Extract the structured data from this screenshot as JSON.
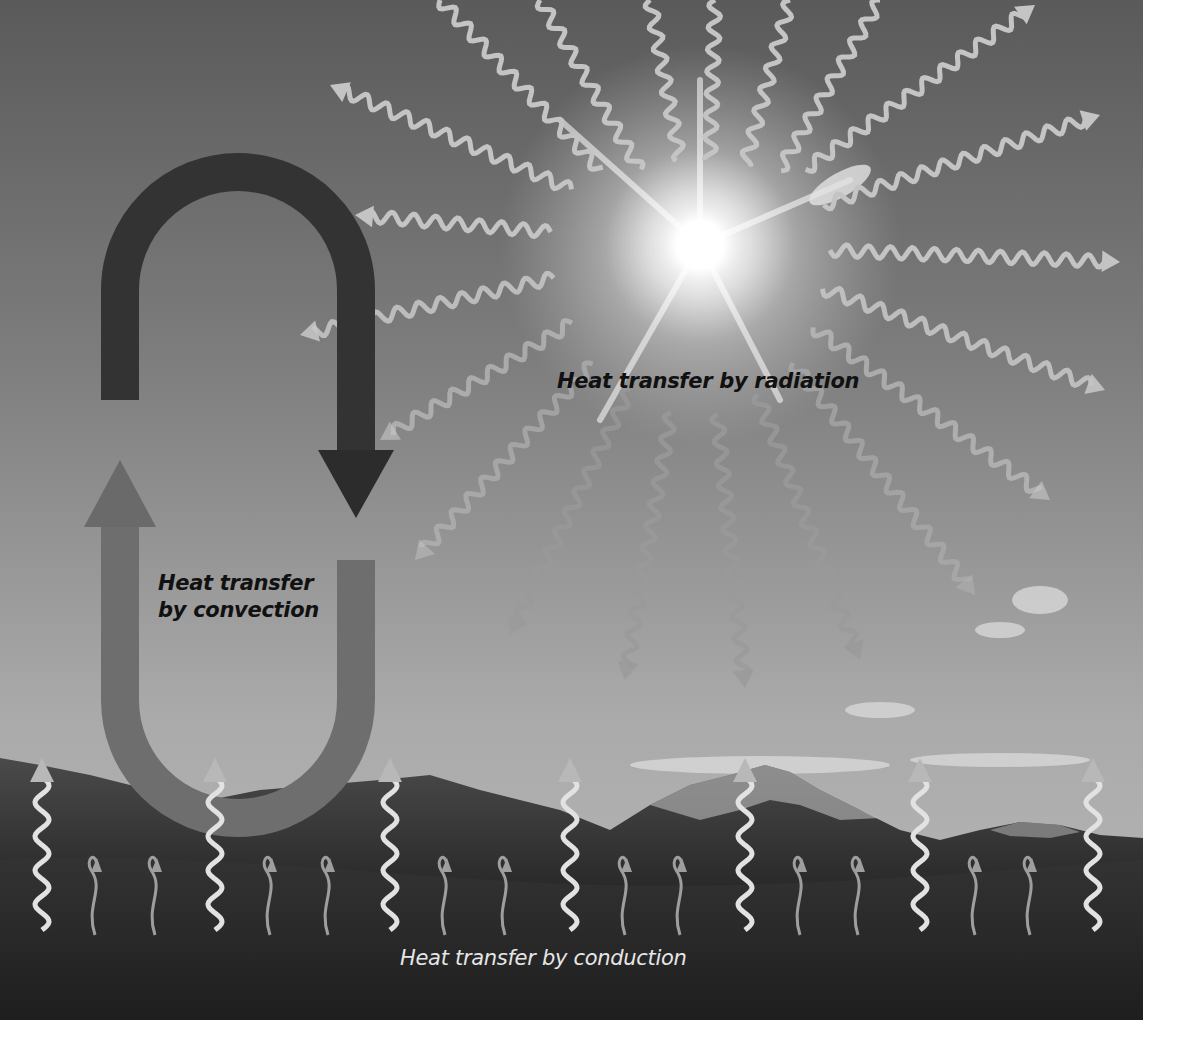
{
  "figure": {
    "labels": {
      "radiation": "Heat transfer by radiation",
      "convection_line1": "Heat transfer",
      "convection_line2": "by convection",
      "conduction": "Heat transfer by conduction"
    },
    "elements": {
      "sun": "bright sun with radiating wavy arrows",
      "convection_loop": "U-shaped loop arrow: dark descending arrow on right, lighter ascending arrow on left",
      "conduction_arrows": "wavy upward arrows rising from ground",
      "landscape": "mountain range and grassy meadow"
    },
    "colors": {
      "sky_top": "#5e5e5e",
      "sky_bottom": "#b4b4b4",
      "sun": "#ffffff",
      "ray": "#c8c8c8",
      "convection_dark": "#2e2e2e",
      "convection_light": "#7a7a7a",
      "mountains": "#3a3a3a",
      "ground": "#2a2a2a",
      "conduction_arrow": "#e0e0e0",
      "page_background": "#ffffff"
    }
  }
}
